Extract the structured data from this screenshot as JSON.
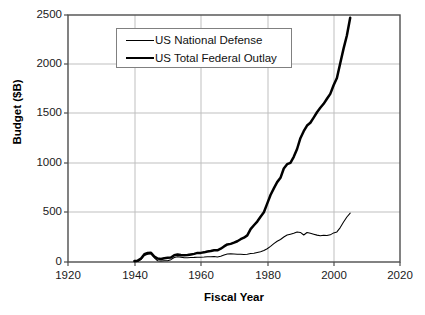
{
  "chart_data": {
    "type": "line",
    "title": "",
    "xlabel": "Fiscal Year",
    "ylabel": "Budget ($B)",
    "xlim": [
      1920,
      2020
    ],
    "ylim": [
      0,
      2500
    ],
    "xticks": [
      1920,
      1940,
      1960,
      1980,
      2000,
      2020
    ],
    "yticks": [
      0,
      500,
      1000,
      1500,
      2000,
      2500
    ],
    "grid": true,
    "legend_position": "upper-left-inside",
    "x": [
      1940,
      1941,
      1942,
      1943,
      1944,
      1945,
      1946,
      1947,
      1948,
      1949,
      1950,
      1951,
      1952,
      1953,
      1954,
      1955,
      1956,
      1957,
      1958,
      1959,
      1960,
      1961,
      1962,
      1963,
      1964,
      1965,
      1966,
      1967,
      1968,
      1969,
      1970,
      1971,
      1972,
      1973,
      1974,
      1975,
      1976,
      1977,
      1978,
      1979,
      1980,
      1981,
      1982,
      1983,
      1984,
      1985,
      1986,
      1987,
      1988,
      1989,
      1990,
      1991,
      1992,
      1993,
      1994,
      1995,
      1996,
      1997,
      1998,
      1999,
      2000,
      2001,
      2002,
      2003,
      2004,
      2005
    ],
    "series": [
      {
        "name": "US National Defense",
        "style": "thin-line",
        "color": "#000000",
        "values": [
          1.7,
          6.4,
          25.7,
          66.7,
          79.1,
          83.0,
          42.7,
          12.8,
          9.1,
          13.2,
          13.7,
          23.6,
          46.1,
          52.8,
          49.3,
          42.7,
          42.5,
          45.4,
          46.8,
          49.0,
          48.1,
          49.6,
          52.3,
          53.4,
          54.8,
          50.6,
          58.1,
          71.4,
          81.9,
          82.5,
          81.7,
          78.9,
          79.2,
          76.7,
          79.3,
          86.5,
          89.6,
          97.2,
          104.5,
          116.3,
          134.0,
          157.5,
          185.3,
          209.9,
          227.4,
          252.7,
          273.4,
          282.0,
          290.4,
          303.6,
          299.3,
          273.3,
          298.3,
          291.1,
          281.6,
          272.1,
          265.8,
          270.5,
          268.2,
          274.8,
          294.4,
          304.7,
          348.5,
          404.7,
          455.8,
          495.3
        ]
      },
      {
        "name": "US Total Federal Outlay",
        "style": "thick-line",
        "color": "#000000",
        "values": [
          9.5,
          13.7,
          35.1,
          78.6,
          91.3,
          92.7,
          55.2,
          34.5,
          29.8,
          38.8,
          42.6,
          45.5,
          67.7,
          76.1,
          70.9,
          68.4,
          70.6,
          76.6,
          82.4,
          92.1,
          92.2,
          97.7,
          106.8,
          111.3,
          118.5,
          118.2,
          134.5,
          157.5,
          178.1,
          183.6,
          195.6,
          210.2,
          230.7,
          245.7,
          269.4,
          332.3,
          371.8,
          409.2,
          458.7,
          504.0,
          590.9,
          678.2,
          745.7,
          808.4,
          851.8,
          946.4,
          990.4,
          1004.0,
          1064.4,
          1143.7,
          1253.0,
          1324.2,
          1381.5,
          1409.4,
          1461.8,
          1515.7,
          1560.5,
          1601.1,
          1652.5,
          1701.8,
          1789.0,
          1862.8,
          2010.9,
          2159.9,
          2292.8,
          2472.0
        ]
      }
    ],
    "notes": {
      "data_x_start": 1940,
      "data_x_end": 2005,
      "outlay_end_value": 2100,
      "defense_end_value": 300
    }
  },
  "axes": {
    "y_tick_labels": [
      "2500",
      "2000",
      "1500",
      "1000",
      "500",
      "0"
    ],
    "x_tick_labels": [
      "1920",
      "1940",
      "1960",
      "1980",
      "2000",
      "2020"
    ],
    "y_axis_title": "Budget ($B)",
    "x_axis_title": "Fiscal Year"
  },
  "legend": {
    "entries": [
      {
        "label": "US National Defense",
        "swatch": "thin-line-swatch"
      },
      {
        "label": "US Total Federal Outlay",
        "swatch": "thick-line-swatch"
      }
    ]
  },
  "colors": {
    "background": "#ffffff",
    "grid": "#bfbfbf",
    "axis": "#404040",
    "line": "#000000",
    "legend_border": "#808080"
  }
}
